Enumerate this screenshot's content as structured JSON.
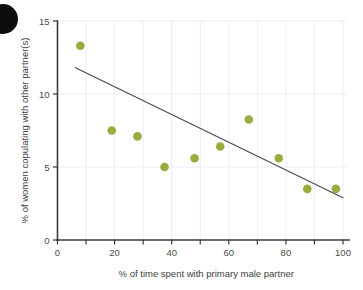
{
  "chart_data": {
    "type": "scatter",
    "title": "",
    "xlabel": "% of time spent with primary male partner",
    "ylabel": "% of women copulating with other partner(s)",
    "xlim": [
      0,
      100
    ],
    "ylim": [
      0,
      15
    ],
    "xticks": [
      0,
      20,
      40,
      60,
      80,
      100
    ],
    "xtick_labels": [
      "0",
      "20",
      "40",
      "60",
      "80",
      "100"
    ],
    "xminor_ticks": [
      10,
      30,
      50,
      70,
      90
    ],
    "yticks": [
      0,
      5,
      10,
      15
    ],
    "ytick_labels": [
      "0",
      "5",
      "10",
      "15"
    ],
    "grid": true,
    "legend": null,
    "point_color": "#9aab40",
    "point_radius": 4.3,
    "line_color": "#4a4a52",
    "axis_color": "#3a3a3a",
    "grid_color": "#e9eef2",
    "points": [
      {
        "x": 8.0,
        "y": 13.3
      },
      {
        "x": 19.0,
        "y": 7.5
      },
      {
        "x": 28.0,
        "y": 7.1
      },
      {
        "x": 37.5,
        "y": 5.0
      },
      {
        "x": 48.0,
        "y": 5.6
      },
      {
        "x": 57.0,
        "y": 6.4
      },
      {
        "x": 67.0,
        "y": 8.25
      },
      {
        "x": 77.5,
        "y": 5.6
      },
      {
        "x": 87.5,
        "y": 3.5
      },
      {
        "x": 97.5,
        "y": 3.5
      }
    ],
    "trendline": {
      "x1": 6.3,
      "y1": 11.8,
      "x2": 100.0,
      "y2": 2.9
    }
  },
  "decoration": {
    "corner_mark": "black-circle"
  }
}
